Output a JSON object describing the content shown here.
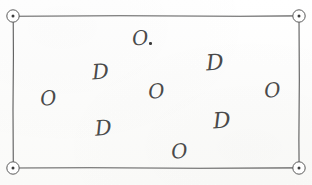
{
  "figure": {
    "background_color": "#fdfdfc",
    "ink_color": "#4a4a4a",
    "line_color": "#5a5a5a"
  },
  "rectangle": {
    "name": "boundary-rectangle",
    "x": 13,
    "y": 16,
    "width": 286,
    "height": 152,
    "stroke_width": 1.1
  },
  "corner_markers": [
    {
      "label": "top-left",
      "cx": 13,
      "cy": 16,
      "r": 6.2,
      "dot_r": 1.5
    },
    {
      "label": "top-right",
      "cx": 299,
      "cy": 16,
      "r": 6.2,
      "dot_r": 1.5
    },
    {
      "label": "bottom-left",
      "cx": 13,
      "cy": 168,
      "r": 6.2,
      "dot_r": 1.5
    },
    {
      "label": "bottom-right",
      "cx": 299,
      "cy": 168,
      "r": 6.2,
      "dot_r": 1.5
    }
  ],
  "glyphs": [
    {
      "text": "O",
      "x": 132,
      "y": 28,
      "size": 20,
      "rotate": -6,
      "has_period": true,
      "period_x": 149,
      "period_y": 42
    },
    {
      "text": "D",
      "x": 92,
      "y": 62,
      "size": 21,
      "rotate": -4,
      "has_period": false
    },
    {
      "text": "D",
      "x": 206,
      "y": 52,
      "size": 22,
      "rotate": -4,
      "has_period": false
    },
    {
      "text": "O",
      "x": 40,
      "y": 88,
      "size": 20,
      "rotate": -7,
      "has_period": false
    },
    {
      "text": "O",
      "x": 148,
      "y": 81,
      "size": 20,
      "rotate": -5,
      "has_period": false
    },
    {
      "text": "O",
      "x": 264,
      "y": 80,
      "size": 20,
      "rotate": -5,
      "has_period": false
    },
    {
      "text": "D",
      "x": 95,
      "y": 118,
      "size": 21,
      "rotate": -5,
      "has_period": false
    },
    {
      "text": "D",
      "x": 213,
      "y": 110,
      "size": 22,
      "rotate": -4,
      "has_period": false
    },
    {
      "text": "O",
      "x": 171,
      "y": 141,
      "size": 20,
      "rotate": -5,
      "has_period": false
    }
  ],
  "counts": {
    "letter_o": 4,
    "letter_d": 4,
    "letter_o_with_period": 1,
    "total_glyphs": 9,
    "corner_markers": 4
  }
}
